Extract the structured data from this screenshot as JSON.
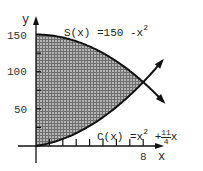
{
  "chart_data": {
    "type": "area",
    "title": "",
    "xlabel": "x",
    "ylabel": "y",
    "xlim": [
      0,
      10
    ],
    "ylim": [
      0,
      160
    ],
    "grid": false,
    "x_ticks": [
      1,
      2,
      3,
      4,
      5,
      6,
      7,
      8
    ],
    "x_tick_labels": [
      {
        "value": 8,
        "label": "8"
      }
    ],
    "y_ticks": [
      25,
      50,
      75,
      100,
      125,
      150
    ],
    "y_tick_labels": [
      {
        "value": 50,
        "label": "50"
      },
      {
        "value": 100,
        "label": "100"
      },
      {
        "value": 150,
        "label": "150"
      }
    ],
    "series": [
      {
        "name": "S(x) = 150 - x^2",
        "formula": "150 - x^2",
        "x": [
          0,
          1,
          2,
          3,
          4,
          5,
          6,
          7,
          8,
          9,
          10
        ],
        "values": [
          150,
          149,
          146,
          141,
          134,
          125,
          114,
          101,
          86,
          69,
          50
        ]
      },
      {
        "name": "C(x) = x^2 + (11/4)x",
        "formula": "x^2 + 11/4 x",
        "x": [
          0,
          1,
          2,
          3,
          4,
          5,
          6,
          7,
          8,
          9,
          10
        ],
        "values": [
          0,
          3.75,
          9.5,
          17.25,
          27,
          38.75,
          52.5,
          68.25,
          86,
          105.75,
          127.5
        ]
      }
    ],
    "shaded_region": {
      "between": [
        "S(x)",
        "C(x)"
      ],
      "x_from": 0,
      "x_to": 8,
      "fill": "crosshatch gray"
    },
    "intersection": {
      "x": 8,
      "y": 86
    },
    "annotations": [
      {
        "text": "S(x) = 150 - x^2",
        "position": "top center"
      },
      {
        "text": "C(x) = x^2 + 11/4 x",
        "position": "bottom right"
      }
    ]
  },
  "labels": {
    "y_axis": "y",
    "x_axis": "x",
    "y150": "150",
    "y100": "100",
    "y50": "50",
    "x8": "8",
    "s_prefix": "S(x) =150 -x",
    "s_exp": "2",
    "c_prefix": "C(x) =x",
    "c_exp": "2",
    "c_plus": "+",
    "c_num": "11",
    "c_den": "4",
    "c_suffix": "x"
  },
  "colors": {
    "curve": "#111111",
    "shade": "#8a8a8a",
    "axis": "#111111"
  }
}
